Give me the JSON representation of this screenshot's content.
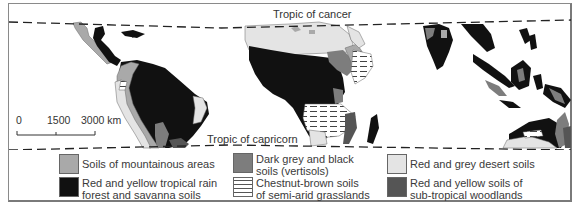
{
  "map": {
    "title_lines": {
      "tropic_of_cancer": "Tropic of cancer",
      "tropic_of_capricorn": "Tropic of capricorn"
    },
    "scale_bar": {
      "ticks": [
        "0",
        "1500",
        "3000 km"
      ]
    }
  },
  "legend": {
    "items": [
      {
        "label_lines": [
          "Soils of mountainous areas"
        ],
        "color": "#a9a9a9",
        "pattern": "solid"
      },
      {
        "label_lines": [
          "Dark grey and black",
          "soils (vertisols)"
        ],
        "color": "#7d7d7d",
        "pattern": "solid"
      },
      {
        "label_lines": [
          "Red and grey desert soils"
        ],
        "color": "#e4e4e4",
        "pattern": "solid"
      },
      {
        "label_lines": [
          "Red and yellow tropical rain",
          "forest and savanna soils"
        ],
        "color": "#111111",
        "pattern": "solid"
      },
      {
        "label_lines": [
          "Chestnut-brown soils",
          "of semi-arid grasslands"
        ],
        "color": "#ffffff",
        "pattern": "horizontal-dashes"
      },
      {
        "label_lines": [
          "Red and yellow soils of",
          "sub-tropical woodlands"
        ],
        "color": "#555555",
        "pattern": "solid"
      }
    ]
  },
  "colors": {
    "mountain": "#a9a9a9",
    "vertisol": "#7d7d7d",
    "desert": "#e4e4e4",
    "rainforest": "#111111",
    "subtropical": "#555555",
    "frame": "#8a8a8a"
  }
}
